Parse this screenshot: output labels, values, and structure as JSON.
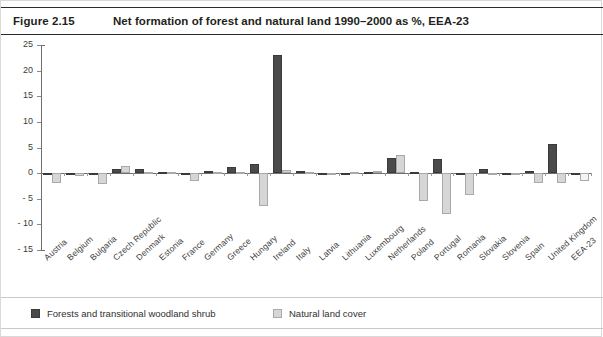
{
  "header": {
    "figure_number": "Figure 2.15",
    "title": "Net formation of forest and natural land 1990–2000 as %, EEA-23"
  },
  "legend": {
    "items": [
      {
        "label": "Forests and transitional woodland shrub",
        "color": "#4a4a4a",
        "key": "forests"
      },
      {
        "label": "Natural land cover",
        "color": "#d6d6d6",
        "key": "natural"
      }
    ]
  },
  "chart_data": {
    "type": "bar",
    "title": "Net formation of forest and natural land 1990–2000 as %, EEA-23",
    "xlabel": "",
    "ylabel": "",
    "ylim": [
      -15,
      25
    ],
    "ytick_step": 5,
    "yticks": [
      "25",
      "20",
      "15",
      "10",
      "5",
      "0",
      "- 5",
      "- 10",
      "- 15"
    ],
    "ytick_values": [
      25,
      20,
      15,
      10,
      5,
      0,
      -5,
      -10,
      -15
    ],
    "grid": false,
    "legend_position": "bottom-left",
    "categories": [
      "Austria",
      "Belgium",
      "Bulgaria",
      "Czech Republic",
      "Denmark",
      "Estonia",
      "France",
      "Germany",
      "Greece",
      "Hungary",
      "Ireland",
      "Italy",
      "Latvia",
      "Lithuania",
      "Luxembourg",
      "Netherlands",
      "Poland",
      "Portugal",
      "Romania",
      "Slovakia",
      "Slovenia",
      "Spain",
      "United Kingdom",
      "EEA-23"
    ],
    "series": [
      {
        "name": "Forests and transitional woodland shrub",
        "color": "#4a4a4a",
        "values": [
          0,
          -0.3,
          0,
          0.8,
          0.9,
          0.2,
          -0.2,
          0.5,
          1.2,
          1.8,
          23,
          0.4,
          0,
          0,
          0.2,
          3,
          0.3,
          2.8,
          0.1,
          0.9,
          0,
          0.5,
          5.7,
          0
        ]
      },
      {
        "name": "Natural land cover",
        "color": "#d6d6d6",
        "values": [
          -2,
          -0.5,
          -2.2,
          1.3,
          0.2,
          0.3,
          -1.6,
          0.2,
          0.3,
          -6.5,
          0.6,
          0.2,
          0.1,
          0.3,
          0.4,
          3.5,
          -5.5,
          -8,
          -4.2,
          0.1,
          -0.4,
          -2,
          -2,
          -1.5
        ]
      }
    ]
  }
}
